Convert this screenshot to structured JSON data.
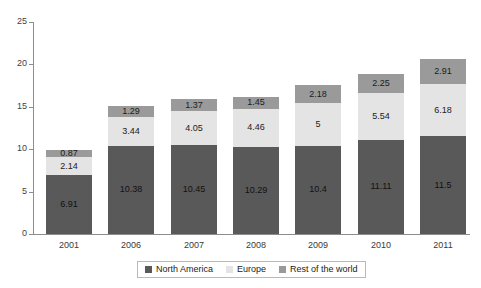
{
  "chart_data": {
    "type": "bar",
    "subtype": "stacked-bar",
    "title": "",
    "subtitle": "",
    "xlabel": "",
    "ylabel": "",
    "categories": [
      "2001",
      "2006",
      "2007",
      "2008",
      "2009",
      "2010",
      "2011"
    ],
    "series": [
      {
        "name": "North America",
        "color": "#59595a",
        "values": [
          6.91,
          10.38,
          10.45,
          10.29,
          10.4,
          11.11,
          11.5
        ],
        "labels": [
          "6.91",
          "10.38",
          "10.45",
          "10.29",
          "10.4",
          "11.11",
          "11.5"
        ]
      },
      {
        "name": "Europe",
        "color": "#e4e4e4",
        "values": [
          2.14,
          3.44,
          4.05,
          4.46,
          5,
          5.54,
          6.18
        ],
        "labels": [
          "2.14",
          "3.44",
          "4.05",
          "4.46",
          "5",
          "5.54",
          "6.18"
        ]
      },
      {
        "name": "Rest of the world",
        "color": "#9a9a9a",
        "values": [
          0.87,
          1.29,
          1.37,
          1.45,
          2.18,
          2.25,
          2.91
        ],
        "labels": [
          "0.87",
          "1.29",
          "1.37",
          "1.45",
          "2.18",
          "2.25",
          "2.91"
        ]
      }
    ],
    "totals": [
      9.92,
      15.11,
      15.87,
      16.2,
      17.58,
      18.9,
      20.59
    ],
    "ylim": [
      0,
      25
    ],
    "yticks": [
      0,
      5,
      10,
      15,
      20,
      25
    ],
    "ytick_labels": [
      "0",
      "5",
      "10",
      "15",
      "20",
      "25"
    ],
    "grid": false,
    "legend_position": "bottom-center",
    "axis_color": "#8d8d8d",
    "background": "#ffffff"
  },
  "legend": {
    "items": [
      {
        "label": "North America",
        "color": "#59595a"
      },
      {
        "label": "Europe",
        "color": "#e4e4e4"
      },
      {
        "label": "Rest of the world",
        "color": "#9a9a9a"
      }
    ]
  }
}
